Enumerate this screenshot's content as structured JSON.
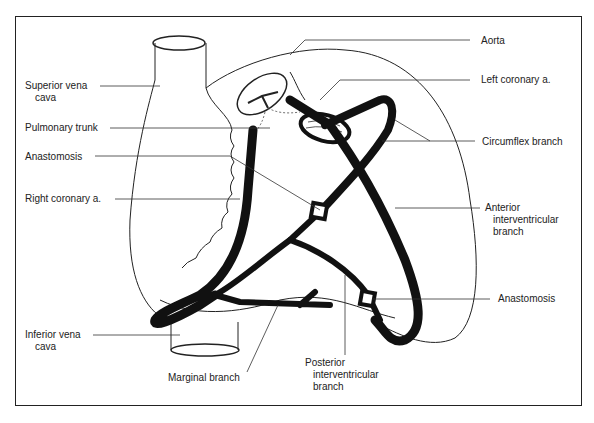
{
  "diagram": {
    "type": "anatomical illustration",
    "colors": {
      "line": "#222222",
      "vessel": "#111111",
      "background": "#ffffff"
    },
    "labels_left": {
      "superior_vena_cava": {
        "line1": "Superior vena",
        "line2": "cava"
      },
      "pulmonary_trunk": "Pulmonary trunk",
      "anastomosis_left": "Anastomosis",
      "right_coronary": "Right coronary a.",
      "inferior_vena_cava": {
        "line1": "Inferior vena",
        "line2": "cava"
      }
    },
    "labels_right": {
      "aorta": "Aorta",
      "left_coronary": "Left coronary a.",
      "circumflex": "Circumflex branch",
      "anterior_interventricular": {
        "line1": "Anterior",
        "line2": "interventricular",
        "line3": "branch"
      },
      "anastomosis_right": "Anastomosis"
    },
    "labels_bottom": {
      "marginal_branch": "Marginal branch",
      "posterior_interventricular": {
        "line1": "Posterior",
        "line2": "interventricular",
        "line3": "branch"
      }
    }
  }
}
